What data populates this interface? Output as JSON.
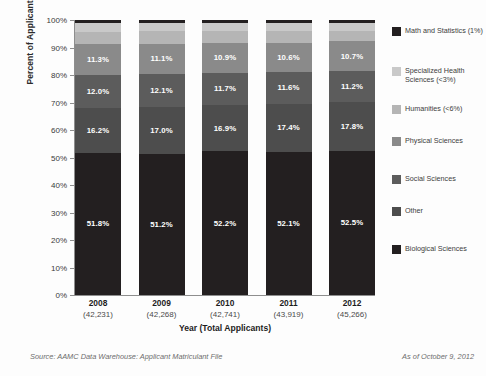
{
  "chart_data": {
    "type": "bar",
    "subtype": "stacked-bar-100",
    "title": "",
    "xlabel": "Year (Total Applicants)",
    "ylabel": "Percent of Applicants",
    "ylim": [
      0,
      100
    ],
    "grid": true,
    "legend_position": "right",
    "categories": [
      "2008",
      "2009",
      "2010",
      "2011",
      "2012"
    ],
    "category_totals": [
      "(42,231)",
      "(42,268)",
      "(42,741)",
      "(43,919)",
      "(45,266)"
    ],
    "ytick_labels": [
      "0%",
      "10%",
      "20%",
      "30%",
      "40%",
      "50%",
      "60%",
      "70%",
      "80%",
      "90%",
      "100%"
    ],
    "ytick_values": [
      0,
      10,
      20,
      30,
      40,
      50,
      60,
      70,
      80,
      90,
      100
    ],
    "series": [
      {
        "name": "Biological Sciences",
        "legend_label": "Biological Sciences",
        "color": "#231f20",
        "values": [
          51.8,
          51.2,
          52.2,
          52.1,
          52.5
        ],
        "labels": [
          "51.8%",
          "51.2%",
          "52.2%",
          "52.1%",
          "52.5%"
        ]
      },
      {
        "name": "Other",
        "legend_label": "Other",
        "color": "#4d4d4d",
        "values": [
          16.2,
          17.0,
          16.9,
          17.4,
          17.8
        ],
        "labels": [
          "16.2%",
          "17.0%",
          "16.9%",
          "17.4%",
          "17.8%"
        ]
      },
      {
        "name": "Social Sciences",
        "legend_label": "Social Sciences",
        "color": "#5c5c5c",
        "values": [
          12.0,
          12.1,
          11.7,
          11.6,
          11.2
        ],
        "labels": [
          "12.0%",
          "12.1%",
          "11.7%",
          "11.6%",
          "11.2%"
        ]
      },
      {
        "name": "Physical Sciences",
        "legend_label": "Physical Sciences",
        "color": "#8a8a8a",
        "values": [
          11.3,
          11.1,
          10.9,
          10.6,
          10.7
        ],
        "labels": [
          "11.3%",
          "11.1%",
          "10.9%",
          "10.6%",
          "10.7%"
        ]
      },
      {
        "name": "Humanities",
        "legend_label": "Humanities (<6%)",
        "color": "#b5b5b5",
        "values": [
          4.5,
          4.5,
          4.2,
          4.2,
          3.9
        ],
        "labels": [
          "",
          "",
          "",
          "",
          ""
        ]
      },
      {
        "name": "Specialized Health Sciences",
        "legend_label": "Specialized Health Sciences (<3%)",
        "color": "#c9c9c9",
        "values": [
          3.2,
          3.1,
          3.1,
          3.1,
          2.9
        ],
        "labels": [
          "",
          "",
          "",
          "",
          ""
        ]
      },
      {
        "name": "Math and Statistics",
        "legend_label": "Math and Statistics (1%)",
        "color": "#231f20",
        "values": [
          1.0,
          1.0,
          1.0,
          1.0,
          1.0
        ],
        "labels": [
          "",
          "",
          "",
          "",
          ""
        ]
      }
    ]
  },
  "legend": {
    "items": [
      {
        "label": "Math and Statistics (1%)",
        "color": "#231f20"
      },
      {
        "label": "Specialized Health Sciences (<3%)",
        "color": "#c9c9c9"
      },
      {
        "label": "Humanities (<6%)",
        "color": "#b5b5b5"
      },
      {
        "label": "Physical Sciences",
        "color": "#8a8a8a"
      },
      {
        "label": "Social Sciences",
        "color": "#5c5c5c"
      },
      {
        "label": "Other",
        "color": "#4d4d4d"
      },
      {
        "label": "Biological Sciences",
        "color": "#231f20"
      }
    ],
    "offsets": [
      0,
      40,
      78,
      110,
      148,
      180,
      218
    ]
  },
  "footer": {
    "source": "Source: AAMC Data Warehouse: Applicant Matriculant File",
    "as_of": "As of October 9, 2012"
  }
}
